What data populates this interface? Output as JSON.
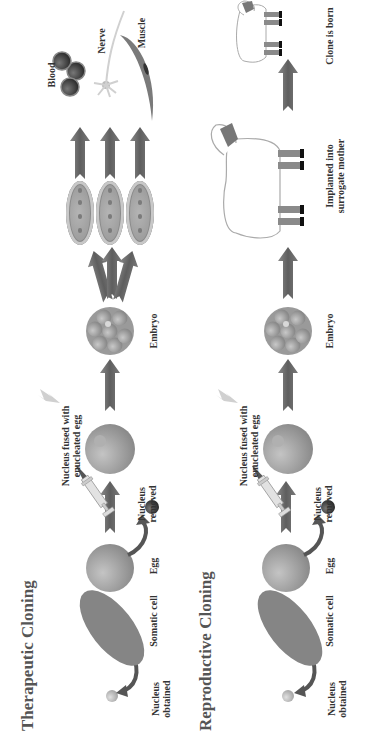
{
  "therapeutic": {
    "title": "Therapeutic Cloning",
    "labels": {
      "nucleus_obtained_1": "Nucleus",
      "nucleus_obtained_2": "obtained",
      "somatic_cell": "Somatic cell",
      "egg": "Egg",
      "nucleus_removed_1": "Nucleus",
      "nucleus_removed_2": "removed",
      "fused_1": "Nucleus fused with",
      "fused_2": "enucleated egg",
      "embryo": "Embryo",
      "blood": "Blood",
      "nerve": "Nerve",
      "muscle": "Muscle"
    }
  },
  "reproductive": {
    "title": "Reproductive Cloning",
    "labels": {
      "nucleus_obtained_1": "Nucleus",
      "nucleus_obtained_2": "obtained",
      "somatic_cell": "Somatic cell",
      "egg": "Egg",
      "nucleus_removed_1": "Nucleus",
      "nucleus_removed_2": "removed",
      "fused_1": "Nucleus fused with",
      "fused_2": "enucleated egg",
      "embryo": "Embryo",
      "implanted_1": "Implanted into",
      "implanted_2": "surrogate mother",
      "clone_born": "Clone is born"
    }
  },
  "colors": {
    "arrow": "#6e6e6e",
    "cell": "#8c8c8c",
    "egg": "#9a9a9a",
    "nucleus_dark": "#4a4a4a",
    "background": "#ffffff"
  }
}
